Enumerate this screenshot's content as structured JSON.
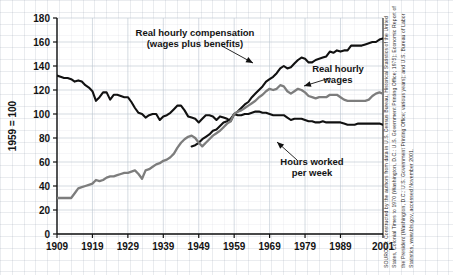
{
  "figure": {
    "background": "#ffffff",
    "grid_color": "#96a0af",
    "source_note": "SOURCES: Constructed by the authors from data in U.S. Census Bureau, Historical Statistics of the United States, Colonial Times to 1970 (Washington, D.C.: U.S. Government Printing Office; 1975); Economic Report of the President (Washington, D.C.: U.S. Government Printing Office; various years); and U.S. Bureau of Labor Statistics, www.bls.gov, accessed November 2001."
  },
  "chart_data": {
    "type": "line",
    "title": "",
    "xlabel": "",
    "ylabel": "1959 = 100",
    "xlim": [
      1909,
      2001
    ],
    "ylim": [
      0,
      180
    ],
    "ytick_labels": [
      "0",
      "20",
      "40",
      "60",
      "80",
      "100",
      "120",
      "140",
      "160",
      "180"
    ],
    "yticks": [
      0,
      20,
      40,
      60,
      80,
      100,
      120,
      140,
      160,
      180
    ],
    "xtick_labels": [
      "1909",
      "1919",
      "1929",
      "1939",
      "1949",
      "1959",
      "1969",
      "1979",
      "1989",
      "2001"
    ],
    "xticks": [
      1909,
      1919,
      1929,
      1939,
      1949,
      1959,
      1969,
      1979,
      1989,
      2001
    ],
    "grid": true,
    "legend": "annotations",
    "annotations": [
      {
        "name": "real-hourly-compensation",
        "line1": "Real hourly compensation",
        "line2": "(wages plus benefits)",
        "x": 195,
        "y": 36,
        "arrow": {
          "x1": 222,
          "y1": 46,
          "x2": 253,
          "y2": 63
        }
      },
      {
        "name": "real-hourly-wages",
        "line1": "Real hourly",
        "line2": "wages",
        "x": 338,
        "y": 72,
        "arrow": {
          "x1": 330,
          "y1": 78,
          "x2": 304,
          "y2": 86
        }
      },
      {
        "name": "hours-worked-per-week",
        "line1": "Hours worked",
        "line2": "per week",
        "x": 312,
        "y": 165,
        "arrow": {
          "x1": 297,
          "y1": 160,
          "x2": 277,
          "y2": 142
        }
      }
    ],
    "series": [
      {
        "name": "Hours worked per week",
        "color": "#111111",
        "width": 2.1,
        "x": [
          1909,
          1910,
          1911,
          1912,
          1913,
          1914,
          1915,
          1916,
          1917,
          1918,
          1919,
          1920,
          1921,
          1922,
          1923,
          1924,
          1925,
          1926,
          1927,
          1928,
          1929,
          1930,
          1931,
          1932,
          1933,
          1934,
          1935,
          1936,
          1937,
          1938,
          1939,
          1940,
          1941,
          1942,
          1943,
          1944,
          1945,
          1946,
          1947,
          1948,
          1949,
          1950,
          1951,
          1952,
          1953,
          1954,
          1955,
          1956,
          1957,
          1958,
          1959,
          1960,
          1961,
          1962,
          1963,
          1964,
          1965,
          1966,
          1967,
          1968,
          1969,
          1970,
          1971,
          1972,
          1973,
          1974,
          1975,
          1976,
          1977,
          1978,
          1979,
          1980,
          1981,
          1982,
          1983,
          1984,
          1985,
          1986,
          1987,
          1988,
          1989,
          1990,
          1991,
          1992,
          1993,
          1994,
          1995,
          1996,
          1997,
          1998,
          1999,
          2000,
          2001
        ],
        "values": [
          132,
          131,
          130,
          130,
          129,
          127,
          128,
          127,
          124,
          122,
          119,
          111,
          114,
          118,
          118,
          112,
          116,
          116,
          115,
          114,
          114,
          110,
          105,
          101,
          100,
          97,
          99,
          100,
          100,
          95,
          98,
          99,
          101,
          104,
          107,
          107,
          103,
          98,
          97,
          96,
          93,
          96,
          99,
          99,
          98,
          95,
          98,
          97,
          96,
          94,
          100,
          99,
          99,
          100,
          100,
          101,
          102,
          102,
          101,
          101,
          100,
          99,
          99,
          99,
          99,
          97,
          95,
          96,
          96,
          96,
          95,
          94,
          94,
          93,
          93,
          94,
          93,
          93,
          93,
          93,
          93,
          92,
          91,
          91,
          91,
          92,
          92,
          92,
          92,
          92,
          92,
          92,
          91
        ]
      },
      {
        "name": "Real hourly compensation (wages plus benefits)",
        "color": "#111111",
        "width": 2.1,
        "x": [
          1947,
          1948,
          1949,
          1950,
          1951,
          1952,
          1953,
          1954,
          1955,
          1956,
          1957,
          1958,
          1959,
          1960,
          1961,
          1962,
          1963,
          1964,
          1965,
          1966,
          1967,
          1968,
          1969,
          1970,
          1971,
          1972,
          1973,
          1974,
          1975,
          1976,
          1977,
          1978,
          1979,
          1980,
          1981,
          1982,
          1983,
          1984,
          1985,
          1986,
          1987,
          1988,
          1989,
          1990,
          1991,
          1992,
          1993,
          1994,
          1995,
          1996,
          1997,
          1998,
          1999,
          2000,
          2001
        ],
        "values": [
          73,
          74,
          76,
          79,
          81,
          83,
          86,
          87,
          90,
          93,
          94,
          96,
          100,
          102,
          105,
          108,
          110,
          114,
          117,
          120,
          123,
          127,
          129,
          131,
          134,
          138,
          140,
          138,
          139,
          142,
          145,
          147,
          146,
          143,
          143,
          145,
          146,
          147,
          148,
          152,
          151,
          153,
          152,
          153,
          153,
          157,
          157,
          157,
          157,
          158,
          159,
          160,
          160,
          162,
          163
        ]
      },
      {
        "name": "Real hourly wages",
        "color": "#7d7d7d",
        "width": 2.3,
        "x": [
          1909,
          1910,
          1911,
          1912,
          1913,
          1914,
          1915,
          1916,
          1917,
          1918,
          1919,
          1920,
          1921,
          1922,
          1923,
          1924,
          1925,
          1926,
          1927,
          1928,
          1929,
          1930,
          1931,
          1932,
          1933,
          1934,
          1935,
          1936,
          1937,
          1938,
          1939,
          1940,
          1941,
          1942,
          1943,
          1944,
          1945,
          1946,
          1947,
          1948,
          1949,
          1950,
          1951,
          1952,
          1953,
          1954,
          1955,
          1956,
          1957,
          1958,
          1959,
          1960,
          1961,
          1962,
          1963,
          1964,
          1965,
          1966,
          1967,
          1968,
          1969,
          1970,
          1971,
          1972,
          1973,
          1974,
          1975,
          1976,
          1977,
          1978,
          1979,
          1980,
          1981,
          1982,
          1983,
          1984,
          1985,
          1986,
          1987,
          1988,
          1989,
          1990,
          1991,
          1992,
          1993,
          1994,
          1995,
          1996,
          1997,
          1998,
          1999,
          2000,
          2001
        ],
        "values": [
          30,
          30,
          30,
          30,
          30,
          34,
          38,
          39,
          40,
          41,
          42,
          45,
          44,
          45,
          47,
          48,
          48,
          49,
          50,
          51,
          51,
          52,
          53,
          50,
          46,
          53,
          54,
          56,
          58,
          59,
          61,
          62,
          64,
          67,
          72,
          76,
          79,
          81,
          82,
          80,
          76,
          73,
          76,
          79,
          82,
          84,
          86,
          89,
          92,
          94,
          100,
          102,
          103,
          105,
          107,
          109,
          111,
          114,
          116,
          119,
          121,
          120,
          121,
          124,
          123,
          119,
          117,
          119,
          121,
          120,
          118,
          115,
          114,
          113,
          114,
          114,
          114,
          116,
          116,
          116,
          114,
          112,
          111,
          111,
          111,
          111,
          111,
          111,
          112,
          115,
          117,
          118,
          117
        ]
      }
    ]
  }
}
